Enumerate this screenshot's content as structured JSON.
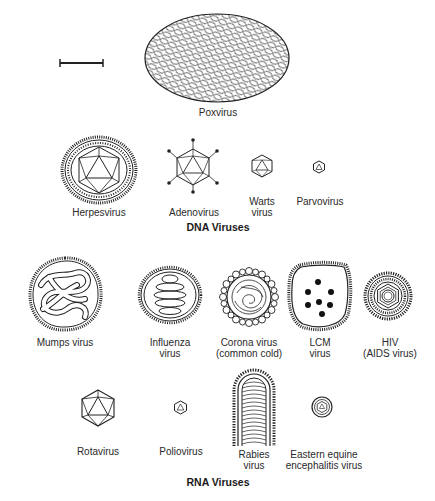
{
  "scale_bar": {
    "label": ""
  },
  "dna": {
    "header": "DNA Viruses",
    "items": [
      {
        "name": "Poxvirus"
      },
      {
        "name": "Herpesvirus"
      },
      {
        "name": "Adenovirus"
      },
      {
        "name": "Warts\nvirus"
      },
      {
        "name": "Parvovirus"
      }
    ]
  },
  "rna": {
    "header": "RNA Viruses",
    "items": [
      {
        "name": "Mumps virus"
      },
      {
        "name": "Influenza\nvirus"
      },
      {
        "name": "Corona virus\n(common cold)"
      },
      {
        "name": "LCM\nvirus"
      },
      {
        "name": "HIV\n(AIDS virus)"
      },
      {
        "name": "Rotavirus"
      },
      {
        "name": "Poliovirus"
      },
      {
        "name": "Rabies\nvirus"
      },
      {
        "name": "Eastern equine\nencephalitis virus"
      }
    ]
  },
  "colors": {
    "ink": "#1a1a1a",
    "background": "#ffffff"
  }
}
